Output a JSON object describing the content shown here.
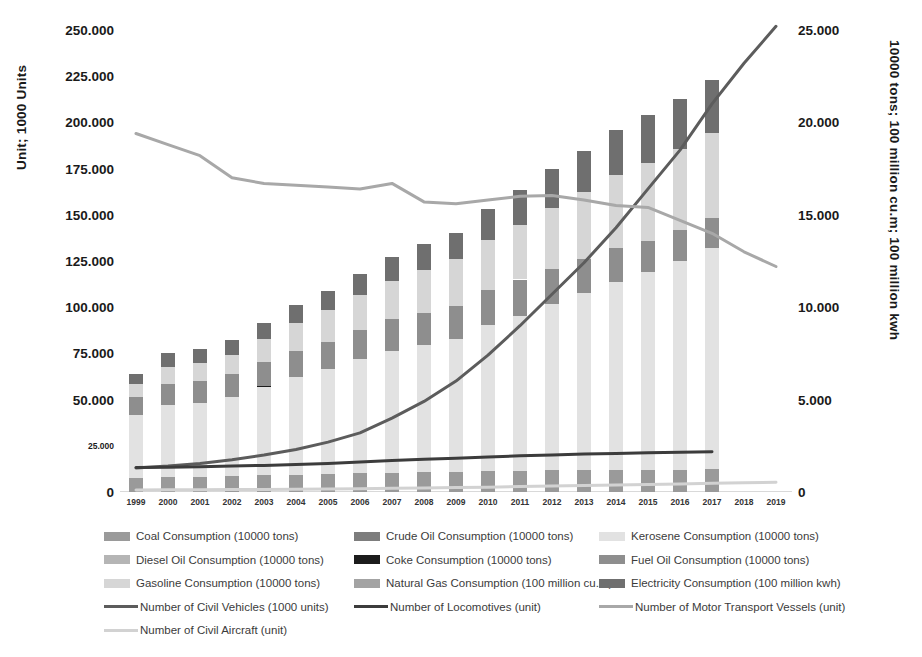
{
  "chart_data": {
    "type": "bar",
    "title": "",
    "subtitle": "",
    "xlabel": "",
    "ylabel": "Unit; 1000 Units",
    "y2label": "10000 tons; 100 million cu.m; 100 million kwh",
    "grid": false,
    "legend_position": "bottom",
    "ylim": [
      0,
      250000
    ],
    "y2lim": [
      0,
      25000
    ],
    "yticks": [
      "0",
      "25.000",
      "50.000",
      "75.000",
      "100.000",
      "125.000",
      "150.000",
      "175.000",
      "200.000",
      "225.000",
      "250.000"
    ],
    "y2ticks": [
      "0",
      "5.000",
      "10.000",
      "15.000",
      "20.000",
      "25.000"
    ],
    "categories": [
      "1999",
      "2000",
      "2001",
      "2002",
      "2003",
      "2004",
      "2005",
      "2006",
      "2007",
      "2008",
      "2009",
      "2010",
      "2011",
      "2012",
      "2013",
      "2014",
      "2015",
      "2016",
      "2017",
      "2018",
      "2019"
    ],
    "stacked": true,
    "bar_series": [
      {
        "name": "Coal Consumption (10000 tons)",
        "axis": "right",
        "color": "#9a9a9a",
        "values": [
          760,
          800,
          820,
          850,
          900,
          940,
          980,
          1010,
          1040,
          1060,
          1090,
          1120,
          1150,
          1170,
          1180,
          1190,
          1200,
          1210,
          1220,
          0,
          0
        ]
      },
      {
        "name": "Crude Oil Consumption (10000 tons)",
        "axis": "right",
        "color": "#7d7d7d",
        "values": [
          0,
          0,
          0,
          0,
          0,
          0,
          0,
          0,
          0,
          0,
          0,
          0,
          0,
          0,
          0,
          0,
          0,
          0,
          0,
          0,
          0
        ]
      },
      {
        "name": "Kerosene Consumption (10000 tons)",
        "axis": "right",
        "color": "#e2e2e2",
        "values": [
          3400,
          3900,
          4000,
          4300,
          4800,
          5300,
          5700,
          6200,
          6600,
          6900,
          7200,
          7900,
          8400,
          9000,
          9600,
          10200,
          10700,
          11300,
          12000,
          0,
          0
        ]
      },
      {
        "name": "Diesel Oil Consumption (10000 tons)",
        "axis": "right",
        "color": "#b5b5b5",
        "values": [
          0,
          0,
          0,
          0,
          0,
          0,
          0,
          0,
          0,
          0,
          0,
          0,
          0,
          0,
          0,
          0,
          0,
          0,
          0,
          0,
          0
        ]
      },
      {
        "name": "Coke Consumption (10000 tons)",
        "axis": "right",
        "color": "#1c1c1c",
        "values": [
          0,
          0,
          0,
          0,
          60,
          0,
          0,
          0,
          0,
          0,
          0,
          0,
          0,
          0,
          0,
          0,
          0,
          0,
          0,
          0,
          0
        ]
      },
      {
        "name": "Fuel Oil Consumption (10000 tons)",
        "axis": "right",
        "color": "#8e8e8e",
        "values": [
          1000,
          1150,
          1200,
          1250,
          1300,
          1400,
          1450,
          1550,
          1700,
          1750,
          1800,
          1900,
          1950,
          1900,
          1850,
          1800,
          1700,
          1650,
          1600,
          0,
          0
        ]
      },
      {
        "name": "Gasoline Consumption (10000 tons)",
        "axis": "right",
        "color": "#d6d6d6",
        "values": [
          700,
          900,
          950,
          1000,
          1200,
          1500,
          1700,
          1900,
          2100,
          2300,
          2500,
          2700,
          2950,
          3300,
          3600,
          3950,
          4200,
          4400,
          4600,
          0,
          0
        ]
      },
      {
        "name": "Natural Gas Consumption (100 million cu.m)",
        "axis": "right",
        "color": "#a3a3a3",
        "values": [
          0,
          0,
          0,
          0,
          0,
          0,
          0,
          0,
          0,
          0,
          0,
          0,
          0,
          0,
          0,
          0,
          0,
          0,
          0,
          0,
          0
        ]
      },
      {
        "name": "Electricity Consumption (100 million kwh)",
        "axis": "right",
        "color": "#6f6f6f",
        "values": [
          500,
          750,
          780,
          800,
          900,
          1000,
          1050,
          1150,
          1300,
          1400,
          1450,
          1700,
          1900,
          2100,
          2250,
          2450,
          2600,
          2700,
          2850,
          0,
          0
        ]
      }
    ],
    "line_series": [
      {
        "name": "Number of Civil Vehicles (1000 units)",
        "axis": "left",
        "color": "#5c5c5c",
        "width": 3,
        "values": [
          13000,
          14000,
          15500,
          17500,
          20000,
          23000,
          27000,
          32000,
          40000,
          49000,
          60000,
          74000,
          90000,
          107000,
          124000,
          143000,
          164000,
          185000,
          210000,
          232000,
          252000
        ]
      },
      {
        "name": "Number of Locomotives (unit)",
        "axis": "left",
        "color": "#3c3c3c",
        "width": 3,
        "values": [
          13200,
          13400,
          13700,
          14000,
          14400,
          14900,
          15500,
          16200,
          17000,
          17700,
          18300,
          19000,
          19600,
          20100,
          20500,
          20900,
          21200,
          21500,
          21800,
          null,
          null
        ]
      },
      {
        "name": "Number of Motor Transport Vessels (unit)",
        "axis": "left",
        "color": "#a8a8a8",
        "width": 3,
        "values": [
          194000,
          188000,
          182000,
          170000,
          167000,
          166000,
          165000,
          164000,
          167000,
          157000,
          156000,
          158000,
          160000,
          160500,
          158000,
          155000,
          154000,
          147000,
          140000,
          130000,
          122000
        ]
      },
      {
        "name": "Number of Civil Aircraft (unit)",
        "axis": "left",
        "color": "#d2d2d2",
        "width": 3,
        "values": [
          1100,
          1200,
          1250,
          1300,
          1400,
          1500,
          1650,
          1800,
          2000,
          2200,
          2400,
          2600,
          2900,
          3200,
          3500,
          3800,
          4100,
          4400,
          4700,
          5000,
          5300
        ]
      }
    ]
  },
  "legend": {
    "rows": [
      [
        {
          "kind": "swatch",
          "label": "Coal Consumption (10000 tons)",
          "color": "#9a9a9a",
          "name": "legend-coal"
        },
        {
          "kind": "swatch",
          "label": "Crude Oil Consumption (10000 tons)",
          "color": "#7d7d7d",
          "name": "legend-crude-oil"
        },
        {
          "kind": "swatch",
          "label": "Kerosene Consumption (10000 tons)",
          "color": "#e2e2e2",
          "name": "legend-kerosene"
        }
      ],
      [
        {
          "kind": "swatch",
          "label": "Diesel Oil Consumption (10000 tons)",
          "color": "#b5b5b5",
          "name": "legend-diesel-oil"
        },
        {
          "kind": "swatch",
          "label": "Coke Consumption (10000 tons)",
          "color": "#1c1c1c",
          "name": "legend-coke"
        },
        {
          "kind": "swatch",
          "label": "Fuel Oil Consumption (10000 tons)",
          "color": "#8e8e8e",
          "name": "legend-fuel-oil"
        }
      ],
      [
        {
          "kind": "swatch",
          "label": "Gasoline Consumption (10000 tons)",
          "color": "#d6d6d6",
          "name": "legend-gasoline"
        },
        {
          "kind": "swatch",
          "label": "Natural Gas Consumption (100 million cu.m)",
          "color": "#a3a3a3",
          "name": "legend-natural-gas"
        },
        {
          "kind": "swatch",
          "label": "Electricity Consumption (100 million kwh)",
          "color": "#6f6f6f",
          "name": "legend-electricity"
        }
      ],
      [
        {
          "kind": "line",
          "label": "Number of Civil Vehicles (1000 units)",
          "color": "#5c5c5c",
          "name": "legend-civil-vehicles"
        },
        {
          "kind": "line",
          "label": "Number of Locomotives (unit)",
          "color": "#3c3c3c",
          "name": "legend-locomotives"
        },
        {
          "kind": "line",
          "label": "Number of Motor Transport Vessels (unit)",
          "color": "#a8a8a8",
          "name": "legend-motor-transport-vessels"
        }
      ],
      [
        {
          "kind": "line",
          "label": "Number of Civil Aircraft (unit)",
          "color": "#d2d2d2",
          "name": "legend-civil-aircraft"
        }
      ]
    ]
  }
}
